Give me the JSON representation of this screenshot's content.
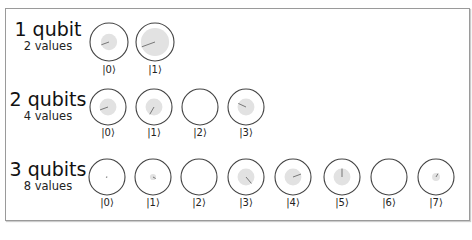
{
  "rows": [
    {
      "title": "1 qubit",
      "subtitle": "2 values",
      "title_pos": {
        "x": 48,
        "y": 20
      },
      "cy": 42,
      "label_y": 64,
      "r": 19,
      "states": [
        {
          "label": "|0⟩",
          "cx": 109,
          "mag": 0.55,
          "angle": 200
        },
        {
          "label": "|1⟩",
          "cx": 155,
          "mag": 0.95,
          "angle": 200
        }
      ]
    },
    {
      "title": "2 qubits",
      "subtitle": "4 values",
      "title_pos": {
        "x": 48,
        "y": 90
      },
      "cy": 107,
      "label_y": 127,
      "r": 18,
      "states": [
        {
          "label": "|0⟩",
          "cx": 108,
          "mag": 0.6,
          "angle": 200
        },
        {
          "label": "|1⟩",
          "cx": 154,
          "mag": 0.6,
          "angle": 240
        },
        {
          "label": "|2⟩",
          "cx": 200,
          "mag": 0.0,
          "angle": 0
        },
        {
          "label": "|3⟩",
          "cx": 246,
          "mag": 0.6,
          "angle": 155
        }
      ]
    },
    {
      "title": "3 qubits",
      "subtitle": "8 values",
      "title_pos": {
        "x": 48,
        "y": 160
      },
      "cy": 177,
      "label_y": 197,
      "r": 18,
      "states": [
        {
          "label": "|0⟩",
          "cx": 107,
          "mag": 0.08,
          "angle": 200
        },
        {
          "label": "|1⟩",
          "cx": 153,
          "mag": 0.22,
          "angle": 330
        },
        {
          "label": "|2⟩",
          "cx": 199,
          "mag": 0.0,
          "angle": 0
        },
        {
          "label": "|3⟩",
          "cx": 246,
          "mag": 0.6,
          "angle": 310
        },
        {
          "label": "|4⟩",
          "cx": 293,
          "mag": 0.6,
          "angle": 20
        },
        {
          "label": "|5⟩",
          "cx": 342,
          "mag": 0.6,
          "angle": 90
        },
        {
          "label": "|6⟩",
          "cx": 389,
          "mag": 0.0,
          "angle": 0
        },
        {
          "label": "|7⟩",
          "cx": 436,
          "mag": 0.28,
          "angle": 60
        }
      ]
    }
  ],
  "colors": {
    "outline": "#444444",
    "fill": "#e2e2e2",
    "phase_line": "#777777",
    "frame": "#9a9a9a"
  }
}
